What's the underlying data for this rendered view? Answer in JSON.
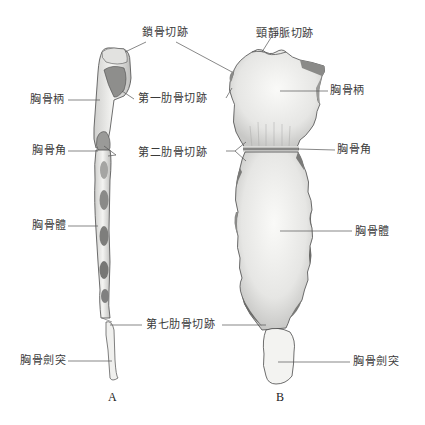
{
  "figure": {
    "panels": [
      {
        "letter": "A",
        "view": "lateral"
      },
      {
        "letter": "B",
        "view": "anterior"
      }
    ],
    "labels": {
      "clavicular_notch": "鎖骨切跡",
      "jugular_notch": "頸靜脈切跡",
      "first_costal_notch": "第一肋骨切跡",
      "manubrium_left": "胸骨柄",
      "manubrium_right": "胸骨柄",
      "sternal_angle_left": "胸骨角",
      "sternal_angle_right": "胸骨角",
      "second_costal_notch": "第二肋骨切跡",
      "body_left": "胸骨體",
      "body_right": "胸骨體",
      "seventh_costal_notch": "第七肋骨切跡",
      "xiphoid_left": "胸骨劍突",
      "xiphoid_right": "胸骨劍突"
    },
    "colors": {
      "line": "#555555",
      "bone_fill": "#ededeb",
      "bone_shade": "#8a8a88",
      "bone_edge": "#4a4a4a"
    }
  }
}
